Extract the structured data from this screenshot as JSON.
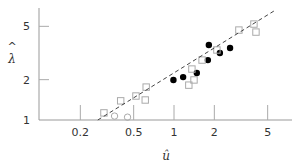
{
  "chart_data": {
    "type": "scatter",
    "title": "",
    "xlabel": "û",
    "ylabel": "λ̂",
    "xscale": "log",
    "yscale": "log",
    "xlim": [
      0.1,
      6.5
    ],
    "ylim": [
      1,
      6.5
    ],
    "xticks": [
      0.2,
      0.5,
      1,
      2,
      5
    ],
    "xtick_labels": [
      "0.2",
      "0.5",
      "1",
      "2",
      "5"
    ],
    "yticks": [
      1,
      2,
      5
    ],
    "ytick_labels": [
      "1",
      "2",
      "5"
    ],
    "grid": false,
    "legend": null,
    "series": [
      {
        "name": "filled circles",
        "marker": "filled-circle",
        "color": "#000000",
        "points": [
          [
            0.99,
            1.99
          ],
          [
            1.17,
            2.09
          ],
          [
            1.48,
            2.24
          ],
          [
            1.79,
            2.8
          ],
          [
            1.82,
            3.63
          ],
          [
            2.2,
            3.16
          ],
          [
            2.62,
            3.45
          ]
        ]
      },
      {
        "name": "open squares",
        "marker": "open-square",
        "color": "#aaaaaa",
        "points": [
          [
            0.3,
            1.13
          ],
          [
            0.4,
            1.39
          ],
          [
            0.52,
            1.51
          ],
          [
            0.62,
            1.76
          ],
          [
            0.61,
            1.41
          ],
          [
            1.29,
            1.82
          ],
          [
            1.36,
            2.4
          ],
          [
            1.41,
            1.99
          ],
          [
            1.62,
            2.8
          ],
          [
            2.09,
            3.33
          ],
          [
            3.05,
            4.69
          ],
          [
            3.95,
            5.2
          ],
          [
            4.09,
            4.53
          ]
        ]
      },
      {
        "name": "open circles",
        "marker": "open-circle",
        "color": "#aaaaaa",
        "points": [
          [
            0.36,
            1.07
          ],
          [
            0.45,
            1.05
          ]
        ]
      },
      {
        "name": "fit line",
        "type": "line",
        "style": "dashed",
        "color": "#444444",
        "points": [
          [
            0.27,
            1.0
          ],
          [
            5.7,
            6.6
          ]
        ]
      }
    ]
  },
  "axes": {
    "x_label": "û",
    "y_label_hat": "^",
    "y_label_char": "λ",
    "x_tick_labels": [
      "0.2",
      "0.5",
      "1",
      "2",
      "5"
    ],
    "y_tick_labels": [
      "1",
      "2",
      "5"
    ]
  }
}
